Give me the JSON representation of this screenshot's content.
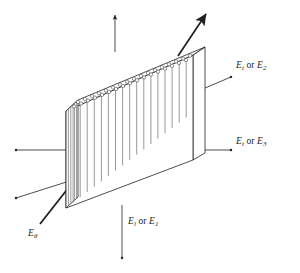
{
  "figure": {
    "kind": "technical-line-diagram",
    "background_color": "#ffffff",
    "line_color": "#231f20",
    "fiber_line_color": "#6e6a6b",
    "canvas": {
      "width": 300,
      "height": 273
    }
  },
  "block": {
    "name": "composite-lamina-block",
    "front_face_fiber_count": 17,
    "side_face_fiber_count": 4,
    "top_face_circle_count": 34,
    "description": "rectangular slab drawn in oblique projection, fibers running vertically"
  },
  "labels": {
    "transverse_2": {
      "symbol": "E",
      "sub_a": "t",
      "conjunction": "or",
      "symbol_b": "E",
      "sub_b": "2",
      "full": "Et or E2"
    },
    "transverse_3": {
      "symbol": "E",
      "sub_a": "t",
      "conjunction": "or",
      "symbol_b": "E",
      "sub_b": "3",
      "full": "Et or E3"
    },
    "longitudinal_1": {
      "symbol": "E",
      "sub_a": "l",
      "conjunction": "or",
      "symbol_b": "E",
      "sub_b": "1",
      "full": "El or E1"
    },
    "angle_theta": {
      "symbol": "E",
      "sub_a": "θ",
      "full": "Eθ"
    }
  },
  "arrows": [
    {
      "name": "arrow-up-vertical",
      "direction": "up",
      "style": "thin",
      "label": null
    },
    {
      "name": "arrow-down-vertical",
      "direction": "down",
      "style": "thin",
      "label": "El or E1"
    },
    {
      "name": "arrow-right-horizontal",
      "direction": "right",
      "style": "thin",
      "label": "Et or E3"
    },
    {
      "name": "arrow-left-horizontal",
      "direction": "left",
      "style": "thin",
      "label": null
    },
    {
      "name": "arrow-upright-diagonal",
      "direction": "up-right",
      "style": "thin",
      "label": "Et or E2"
    },
    {
      "name": "arrow-downleft-diagonal",
      "direction": "down-left",
      "style": "thin",
      "label": null
    },
    {
      "name": "arrow-upright-thick",
      "direction": "up-right",
      "style": "thick",
      "label": null
    },
    {
      "name": "leader-etheta",
      "direction": "up-right",
      "style": "thick",
      "label": "Eθ"
    }
  ]
}
